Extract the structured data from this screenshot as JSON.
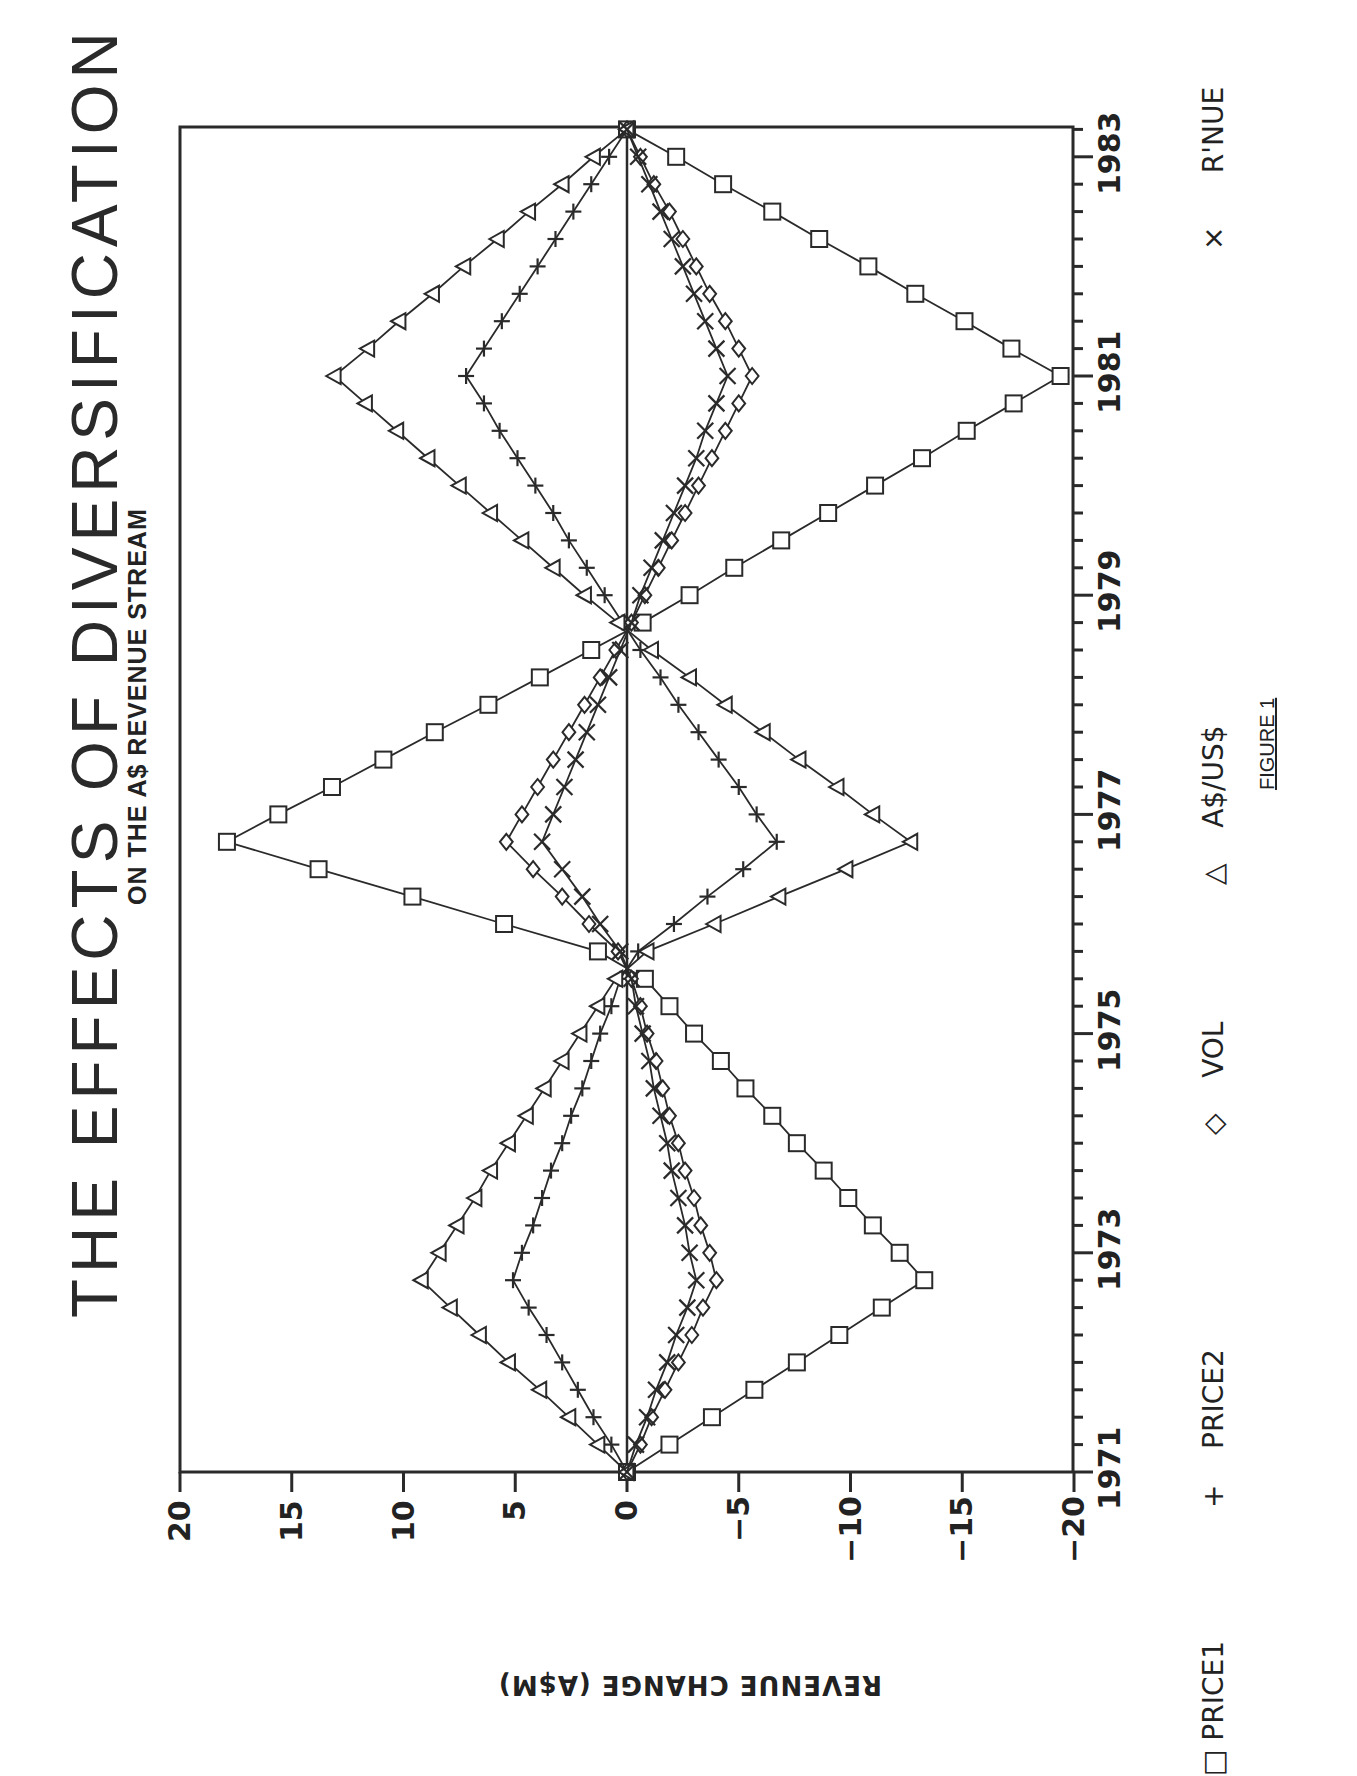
{
  "title": "THE EFFECTS OF DIVERSIFICATION",
  "subtitle": "ON THE A$ REVENUE STREAM",
  "ylabel": "REVENUE CHANGE (A$M)",
  "figure_caption": "FIGURE 1",
  "legend": [
    {
      "marker": "□",
      "label": "PRICE1"
    },
    {
      "marker": "+",
      "label": "PRICE2"
    },
    {
      "marker": "◇",
      "label": "VOL"
    },
    {
      "marker": "△",
      "label": "A$/US$"
    },
    {
      "marker": "×",
      "label": "R'NUE"
    }
  ],
  "x_tick_labels": [
    "1971",
    "1973",
    "1975",
    "1977",
    "1979",
    "1981",
    "1983"
  ],
  "y_tick_labels": [
    "20",
    "15",
    "10",
    "5",
    "0",
    "−5",
    "−10",
    "−15",
    "−20"
  ],
  "chart_data": {
    "type": "line",
    "orientation": "rotated 90° clockwise on page (time runs bottom-to-top)",
    "title": "THE EFFECTS OF DIVERSIFICATION",
    "subtitle": "ON THE A$ REVENUE STREAM",
    "xlabel": "",
    "ylabel": "REVENUE CHANGE (A$M)",
    "xlim": [
      1971,
      1983.25
    ],
    "ylim": [
      -20,
      20
    ],
    "x_ticks": [
      1971,
      1973,
      1975,
      1977,
      1979,
      1981,
      1983
    ],
    "x_minor_tick_step": 0.25,
    "y_ticks": [
      20,
      15,
      10,
      5,
      0,
      -5,
      -10,
      -15,
      -20
    ],
    "grid": false,
    "zero_line": true,
    "legend_position": "bottom (right edge of page)",
    "x": [
      1971.0,
      1971.25,
      1971.5,
      1971.75,
      1972.0,
      1972.25,
      1972.5,
      1972.75,
      1973.0,
      1973.25,
      1973.5,
      1973.75,
      1974.0,
      1974.25,
      1974.5,
      1974.75,
      1975.0,
      1975.25,
      1975.5,
      1975.75,
      1976.0,
      1976.25,
      1976.5,
      1976.75,
      1977.0,
      1977.25,
      1977.5,
      1977.75,
      1978.0,
      1978.25,
      1978.5,
      1978.75,
      1979.0,
      1979.25,
      1979.5,
      1979.75,
      1980.0,
      1980.25,
      1980.5,
      1980.75,
      1981.0,
      1981.25,
      1981.5,
      1981.75,
      1982.0,
      1982.25,
      1982.5,
      1982.75,
      1983.0,
      1983.25
    ],
    "series": [
      {
        "name": "PRICE1",
        "marker": "square",
        "values": [
          0,
          -1.9,
          -3.8,
          -5.7,
          -7.6,
          -9.5,
          -11.4,
          -13.3,
          -12.2,
          -11.0,
          -9.9,
          -8.8,
          -7.6,
          -6.5,
          -5.3,
          -4.2,
          -3.0,
          -1.9,
          -0.8,
          1.3,
          5.5,
          9.6,
          13.8,
          17.9,
          15.6,
          13.2,
          10.9,
          8.6,
          6.2,
          3.9,
          1.6,
          -0.7,
          -2.8,
          -4.8,
          -6.9,
          -9.0,
          -11.1,
          -13.2,
          -15.2,
          -17.3,
          -19.4,
          -17.2,
          -15.1,
          -12.9,
          -10.8,
          -8.6,
          -6.5,
          -4.3,
          -2.2,
          0
        ]
      },
      {
        "name": "PRICE2",
        "marker": "plus",
        "values": [
          0,
          0.7,
          1.5,
          2.2,
          2.9,
          3.6,
          4.4,
          5.1,
          4.7,
          4.2,
          3.8,
          3.4,
          2.9,
          2.5,
          2.0,
          1.6,
          1.2,
          0.7,
          0.3,
          -0.5,
          -2.1,
          -3.6,
          -5.2,
          -6.7,
          -5.8,
          -5.0,
          -4.1,
          -3.2,
          -2.3,
          -1.5,
          -0.6,
          0.2,
          1.0,
          1.8,
          2.6,
          3.3,
          4.1,
          4.9,
          5.7,
          6.4,
          7.2,
          6.4,
          5.6,
          4.8,
          4.0,
          3.2,
          2.4,
          1.6,
          0.8,
          0
        ]
      },
      {
        "name": "VOL",
        "marker": "diamond",
        "values": [
          0,
          -0.6,
          -1.1,
          -1.7,
          -2.3,
          -2.9,
          -3.4,
          -4.0,
          -3.7,
          -3.3,
          -3.0,
          -2.6,
          -2.3,
          -1.9,
          -1.6,
          -1.3,
          -0.9,
          -0.6,
          -0.2,
          0.4,
          1.7,
          2.9,
          4.2,
          5.4,
          4.7,
          4.0,
          3.3,
          2.6,
          1.9,
          1.2,
          0.5,
          -0.2,
          -0.8,
          -1.4,
          -2.0,
          -2.6,
          -3.2,
          -3.8,
          -4.4,
          -5.0,
          -5.6,
          -5.0,
          -4.4,
          -3.7,
          -3.1,
          -2.5,
          -1.9,
          -1.2,
          -0.6,
          0
        ]
      },
      {
        "name": "A$/US$",
        "marker": "triangle",
        "values": [
          0,
          1.3,
          2.6,
          3.9,
          5.3,
          6.6,
          7.9,
          9.2,
          8.4,
          7.6,
          6.8,
          6.1,
          5.3,
          4.5,
          3.7,
          2.9,
          2.1,
          1.3,
          0.5,
          -0.9,
          -3.9,
          -6.8,
          -9.8,
          -12.7,
          -11.0,
          -9.4,
          -7.7,
          -6.1,
          -4.4,
          -2.8,
          -1.1,
          0.4,
          1.9,
          3.3,
          4.7,
          6.1,
          7.5,
          8.9,
          10.3,
          11.7,
          13.1,
          11.6,
          10.2,
          8.7,
          7.3,
          5.8,
          4.4,
          2.9,
          1.5,
          0
        ]
      },
      {
        "name": "R'NUE",
        "marker": "x",
        "values": [
          0,
          -0.4,
          -0.9,
          -1.3,
          -1.8,
          -2.2,
          -2.7,
          -3.1,
          -2.8,
          -2.6,
          -2.3,
          -2.0,
          -1.8,
          -1.5,
          -1.2,
          -1.0,
          -0.7,
          -0.4,
          -0.2,
          0.3,
          1.2,
          2.0,
          2.9,
          3.8,
          3.3,
          2.8,
          2.3,
          1.8,
          1.3,
          0.8,
          0.3,
          -0.2,
          -0.6,
          -1.1,
          -1.6,
          -2.1,
          -2.6,
          -3.1,
          -3.5,
          -4.0,
          -4.5,
          -4.0,
          -3.5,
          -3.0,
          -2.5,
          -2.0,
          -1.5,
          -1.0,
          -0.5,
          0
        ]
      }
    ]
  }
}
